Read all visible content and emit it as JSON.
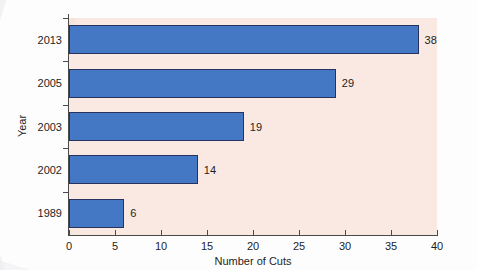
{
  "chart_data": {
    "type": "bar",
    "orientation": "horizontal",
    "title": "",
    "xlabel": "Number of Cuts",
    "ylabel": "Year",
    "categories": [
      "2013",
      "2005",
      "2003",
      "2002",
      "1989"
    ],
    "values": [
      38,
      29,
      19,
      14,
      6
    ],
    "value_labels": [
      "38",
      "29",
      "19",
      "14",
      "6"
    ],
    "xlim": [
      0,
      40
    ],
    "xticks": [
      0,
      5,
      10,
      15,
      20,
      25,
      30,
      35,
      40
    ],
    "xtick_labels": [
      "0",
      "5",
      "10",
      "15",
      "20",
      "25",
      "30",
      "35",
      "40"
    ],
    "ytick_labels": [
      "2013",
      "2005",
      "2003",
      "2002",
      "1989"
    ],
    "grid": false,
    "legend": null,
    "bar_color": "#4477c4",
    "bar_edge_color": "#27325e",
    "plot_background": "#f9e9e2",
    "page_background": "#fdfdfd",
    "axis_color": "#4a4a4a",
    "text_color": "#1d1d1d"
  }
}
